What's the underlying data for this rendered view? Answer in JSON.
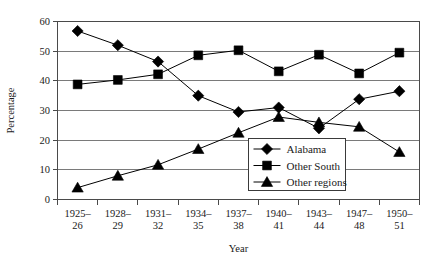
{
  "chart_data": {
    "type": "line",
    "title": "",
    "xlabel": "Year",
    "ylabel": "Percentage",
    "ylim": [
      0,
      60
    ],
    "yticks": [
      0,
      10,
      20,
      30,
      40,
      50,
      60
    ],
    "grid": true,
    "legend_position": "inside-bottom-center",
    "categories": [
      "1925–26",
      "1928–29",
      "1931–32",
      "1934–35",
      "1937–38",
      "1940–41",
      "1943–44",
      "1947–48",
      "1950–51"
    ],
    "series": [
      {
        "name": "Alabama",
        "marker": "diamond",
        "values": [
          56.8,
          52.0,
          46.5,
          35.0,
          29.5,
          31.0,
          24.0,
          33.8,
          36.5
        ]
      },
      {
        "name": "Other South",
        "marker": "square",
        "values": [
          38.8,
          40.3,
          42.2,
          48.6,
          50.3,
          43.2,
          48.8,
          42.5,
          49.5
        ]
      },
      {
        "name": "Other regions",
        "marker": "triangle",
        "values": [
          4.0,
          8.0,
          11.7,
          17.0,
          22.5,
          27.8,
          26.0,
          24.5,
          16.0
        ]
      }
    ]
  },
  "axes": {
    "ylabel": "Percentage",
    "xlabel": "Year",
    "ytick_labels": [
      "0",
      "10",
      "20",
      "30",
      "40",
      "50",
      "60"
    ],
    "xtick_labels_top": [
      "1925–",
      "1928–",
      "1931–",
      "1934–",
      "1937–",
      "1940–",
      "1943–",
      "1947–",
      "1950–"
    ],
    "xtick_labels_bottom": [
      "26",
      "29",
      "32",
      "35",
      "38",
      "41",
      "44",
      "48",
      "51"
    ]
  },
  "legend": {
    "items": [
      {
        "label": "Alabama",
        "marker": "diamond"
      },
      {
        "label": "Other South",
        "marker": "square"
      },
      {
        "label": "Other regions",
        "marker": "triangle"
      }
    ]
  },
  "colors": {
    "series": "#000000",
    "grid": "#7a7a7a",
    "frame": "#4a4a4a",
    "background": "#ffffff",
    "text": "#1a1a1a"
  }
}
